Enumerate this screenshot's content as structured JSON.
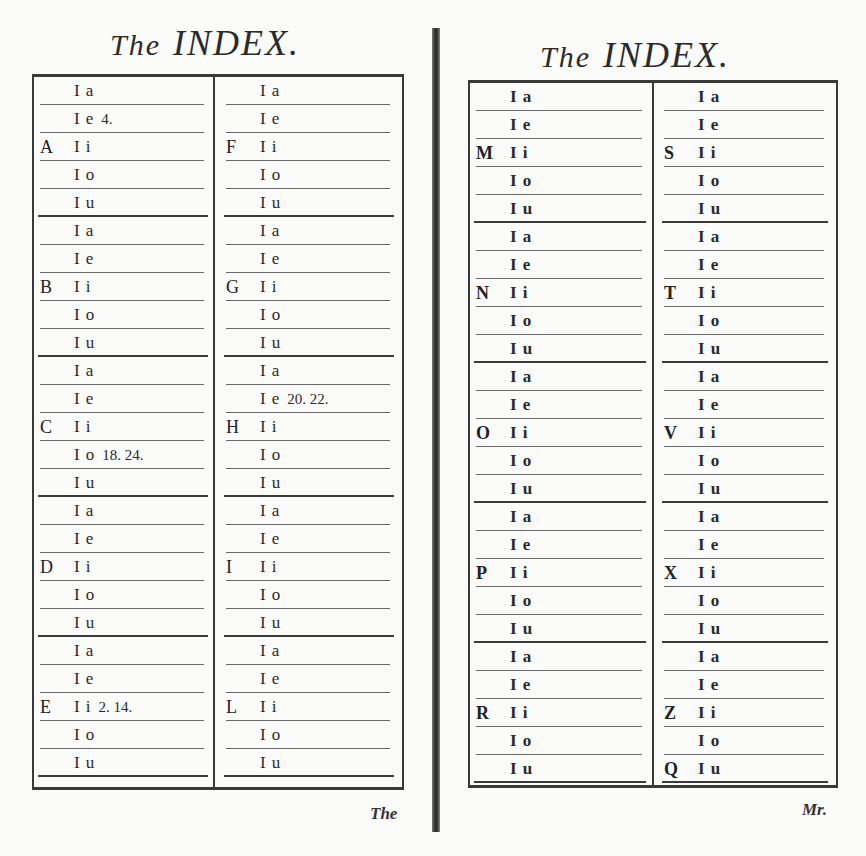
{
  "left_page": {
    "title_the": "The",
    "title_main": "INDEX.",
    "catchword": "The",
    "columns": [
      {
        "blocks": [
          {
            "letter": "A",
            "rows": [
              {
                "l": "I",
                "v": "a",
                "pages": ""
              },
              {
                "l": "I",
                "v": "e",
                "pages": "4."
              },
              {
                "l": "I",
                "v": "i",
                "pages": ""
              },
              {
                "l": "I",
                "v": "o",
                "pages": ""
              },
              {
                "l": "I",
                "v": "u",
                "pages": ""
              }
            ]
          },
          {
            "letter": "B",
            "rows": [
              {
                "l": "I",
                "v": "a",
                "pages": ""
              },
              {
                "l": "I",
                "v": "e",
                "pages": ""
              },
              {
                "l": "I",
                "v": "i",
                "pages": ""
              },
              {
                "l": "I",
                "v": "o",
                "pages": ""
              },
              {
                "l": "I",
                "v": "u",
                "pages": ""
              }
            ]
          },
          {
            "letter": "C",
            "rows": [
              {
                "l": "I",
                "v": "a",
                "pages": ""
              },
              {
                "l": "I",
                "v": "e",
                "pages": ""
              },
              {
                "l": "I",
                "v": "i",
                "pages": ""
              },
              {
                "l": "I",
                "v": "o",
                "pages": "18. 24."
              },
              {
                "l": "I",
                "v": "u",
                "pages": ""
              }
            ]
          },
          {
            "letter": "D",
            "rows": [
              {
                "l": "I",
                "v": "a",
                "pages": ""
              },
              {
                "l": "I",
                "v": "e",
                "pages": ""
              },
              {
                "l": "I",
                "v": "i",
                "pages": ""
              },
              {
                "l": "I",
                "v": "o",
                "pages": ""
              },
              {
                "l": "I",
                "v": "u",
                "pages": ""
              }
            ]
          },
          {
            "letter": "E",
            "rows": [
              {
                "l": "I",
                "v": "a",
                "pages": ""
              },
              {
                "l": "I",
                "v": "e",
                "pages": ""
              },
              {
                "l": "I",
                "v": "i",
                "pages": "2. 14."
              },
              {
                "l": "I",
                "v": "o",
                "pages": ""
              },
              {
                "l": "I",
                "v": "u",
                "pages": ""
              }
            ]
          }
        ]
      },
      {
        "blocks": [
          {
            "letter": "F",
            "rows": [
              {
                "l": "I",
                "v": "a",
                "pages": ""
              },
              {
                "l": "I",
                "v": "e",
                "pages": ""
              },
              {
                "l": "I",
                "v": "i",
                "pages": ""
              },
              {
                "l": "I",
                "v": "o",
                "pages": ""
              },
              {
                "l": "I",
                "v": "u",
                "pages": ""
              }
            ]
          },
          {
            "letter": "G",
            "rows": [
              {
                "l": "I",
                "v": "a",
                "pages": ""
              },
              {
                "l": "I",
                "v": "e",
                "pages": ""
              },
              {
                "l": "I",
                "v": "i",
                "pages": ""
              },
              {
                "l": "I",
                "v": "o",
                "pages": ""
              },
              {
                "l": "I",
                "v": "u",
                "pages": ""
              }
            ]
          },
          {
            "letter": "H",
            "rows": [
              {
                "l": "I",
                "v": "a",
                "pages": ""
              },
              {
                "l": "I",
                "v": "e",
                "pages": "20. 22."
              },
              {
                "l": "I",
                "v": "i",
                "pages": ""
              },
              {
                "l": "I",
                "v": "o",
                "pages": ""
              },
              {
                "l": "I",
                "v": "u",
                "pages": ""
              }
            ]
          },
          {
            "letter": "I",
            "rows": [
              {
                "l": "I",
                "v": "a",
                "pages": ""
              },
              {
                "l": "I",
                "v": "e",
                "pages": ""
              },
              {
                "l": "I",
                "v": "i",
                "pages": ""
              },
              {
                "l": "I",
                "v": "o",
                "pages": ""
              },
              {
                "l": "I",
                "v": "u",
                "pages": ""
              }
            ]
          },
          {
            "letter": "L",
            "rows": [
              {
                "l": "I",
                "v": "a",
                "pages": ""
              },
              {
                "l": "I",
                "v": "e",
                "pages": ""
              },
              {
                "l": "I",
                "v": "i",
                "pages": ""
              },
              {
                "l": "I",
                "v": "o",
                "pages": ""
              },
              {
                "l": "I",
                "v": "u",
                "pages": ""
              }
            ]
          }
        ]
      }
    ]
  },
  "right_page": {
    "title_the": "The",
    "title_main": "INDEX.",
    "catchword": "Mr.",
    "columns": [
      {
        "blocks": [
          {
            "letter": "M",
            "rows": [
              {
                "l": "I",
                "v": "a",
                "pages": ""
              },
              {
                "l": "I",
                "v": "e",
                "pages": ""
              },
              {
                "l": "I",
                "v": "i",
                "pages": ""
              },
              {
                "l": "I",
                "v": "o",
                "pages": ""
              },
              {
                "l": "I",
                "v": "u",
                "pages": ""
              }
            ]
          },
          {
            "letter": "N",
            "rows": [
              {
                "l": "I",
                "v": "a",
                "pages": ""
              },
              {
                "l": "I",
                "v": "e",
                "pages": ""
              },
              {
                "l": "I",
                "v": "i",
                "pages": ""
              },
              {
                "l": "I",
                "v": "o",
                "pages": ""
              },
              {
                "l": "I",
                "v": "u",
                "pages": ""
              }
            ]
          },
          {
            "letter": "O",
            "rows": [
              {
                "l": "I",
                "v": "a",
                "pages": ""
              },
              {
                "l": "I",
                "v": "e",
                "pages": ""
              },
              {
                "l": "I",
                "v": "i",
                "pages": ""
              },
              {
                "l": "I",
                "v": "o",
                "pages": ""
              },
              {
                "l": "I",
                "v": "u",
                "pages": ""
              }
            ]
          },
          {
            "letter": "P",
            "rows": [
              {
                "l": "I",
                "v": "a",
                "pages": ""
              },
              {
                "l": "I",
                "v": "e",
                "pages": ""
              },
              {
                "l": "I",
                "v": "i",
                "pages": ""
              },
              {
                "l": "I",
                "v": "o",
                "pages": ""
              },
              {
                "l": "I",
                "v": "u",
                "pages": ""
              }
            ]
          },
          {
            "letter": "R",
            "rows": [
              {
                "l": "I",
                "v": "a",
                "pages": ""
              },
              {
                "l": "I",
                "v": "e",
                "pages": ""
              },
              {
                "l": "I",
                "v": "i",
                "pages": ""
              },
              {
                "l": "I",
                "v": "o",
                "pages": ""
              },
              {
                "l": "I",
                "v": "u",
                "pages": ""
              }
            ]
          }
        ]
      },
      {
        "blocks": [
          {
            "letter": "S",
            "rows": [
              {
                "l": "I",
                "v": "a",
                "pages": ""
              },
              {
                "l": "I",
                "v": "e",
                "pages": ""
              },
              {
                "l": "I",
                "v": "i",
                "pages": ""
              },
              {
                "l": "I",
                "v": "o",
                "pages": ""
              },
              {
                "l": "I",
                "v": "u",
                "pages": ""
              }
            ]
          },
          {
            "letter": "T",
            "rows": [
              {
                "l": "I",
                "v": "a",
                "pages": ""
              },
              {
                "l": "I",
                "v": "e",
                "pages": ""
              },
              {
                "l": "I",
                "v": "i",
                "pages": ""
              },
              {
                "l": "I",
                "v": "o",
                "pages": ""
              },
              {
                "l": "I",
                "v": "u",
                "pages": ""
              }
            ]
          },
          {
            "letter": "V",
            "rows": [
              {
                "l": "I",
                "v": "a",
                "pages": ""
              },
              {
                "l": "I",
                "v": "e",
                "pages": ""
              },
              {
                "l": "I",
                "v": "i",
                "pages": ""
              },
              {
                "l": "I",
                "v": "o",
                "pages": ""
              },
              {
                "l": "I",
                "v": "u",
                "pages": ""
              }
            ]
          },
          {
            "letter": "X",
            "rows": [
              {
                "l": "I",
                "v": "a",
                "pages": ""
              },
              {
                "l": "I",
                "v": "e",
                "pages": ""
              },
              {
                "l": "I",
                "v": "i",
                "pages": ""
              },
              {
                "l": "I",
                "v": "o",
                "pages": ""
              },
              {
                "l": "I",
                "v": "u",
                "pages": ""
              }
            ]
          },
          {
            "letter": "Z",
            "letter2": "Q",
            "rows": [
              {
                "l": "I",
                "v": "a",
                "pages": ""
              },
              {
                "l": "I",
                "v": "e",
                "pages": ""
              },
              {
                "l": "I",
                "v": "i",
                "pages": ""
              },
              {
                "l": "I",
                "v": "o",
                "pages": ""
              },
              {
                "l": "I",
                "v": "u",
                "pages": ""
              }
            ]
          }
        ]
      }
    ]
  }
}
